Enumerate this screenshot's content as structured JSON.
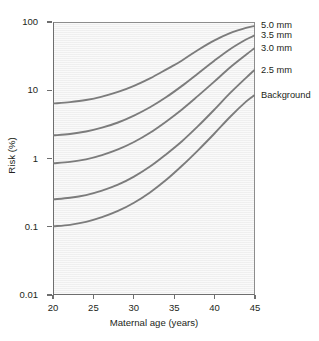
{
  "chart_data": {
    "type": "line",
    "title": "",
    "xlabel": "Maternal age (years)",
    "ylabel": "Risk (%)",
    "xlim": [
      20,
      45
    ],
    "ylim": [
      0.01,
      100
    ],
    "yscale": "log",
    "xscale": "linear",
    "grid": false,
    "legend_position": "right",
    "xticks": [
      "20",
      "25",
      "30",
      "35",
      "40",
      "45"
    ],
    "xtick_values": [
      20,
      25,
      30,
      35,
      40,
      45
    ],
    "yticks": [
      "100",
      "10",
      "1",
      "0.1",
      "0.01"
    ],
    "ytick_values": [
      100,
      10,
      1,
      0.1,
      0.01
    ],
    "x": [
      20,
      22,
      24,
      26,
      28,
      30,
      32,
      34,
      36,
      38,
      40,
      42,
      44,
      45
    ],
    "series": [
      {
        "name": "5.0 mm",
        "color": "#7c7c7c",
        "values": [
          6.5,
          6.8,
          7.3,
          8.2,
          9.6,
          11.8,
          15.2,
          20.5,
          28.0,
          40.0,
          55.0,
          71.0,
          85.0,
          90.0
        ]
      },
      {
        "name": "3.5 mm",
        "color": "#7c7c7c",
        "values": [
          2.2,
          2.3,
          2.5,
          2.85,
          3.4,
          4.3,
          5.7,
          8.0,
          11.8,
          18.0,
          27.5,
          41.0,
          57.0,
          65.0
        ]
      },
      {
        "name": "3.0 mm",
        "color": "#7c7c7c",
        "values": [
          0.85,
          0.89,
          0.97,
          1.12,
          1.36,
          1.75,
          2.4,
          3.5,
          5.3,
          8.4,
          13.5,
          22.0,
          34.0,
          42.0
        ]
      },
      {
        "name": "2.5 mm",
        "color": "#7c7c7c",
        "values": [
          0.25,
          0.263,
          0.288,
          0.335,
          0.41,
          0.54,
          0.76,
          1.15,
          1.8,
          3.0,
          5.2,
          9.2,
          15.5,
          20.0
        ]
      },
      {
        "name": "Background",
        "color": "#7c7c7c",
        "values": [
          0.1,
          0.105,
          0.116,
          0.136,
          0.168,
          0.222,
          0.315,
          0.48,
          0.78,
          1.32,
          2.3,
          4.1,
          6.9,
          8.5
        ]
      }
    ],
    "annotations": []
  },
  "axes": {
    "y_title": "Risk (%)",
    "x_title": "Maternal age (years)",
    "y_tick_labels": [
      "100",
      "10",
      "1",
      "0.1",
      "0.01"
    ],
    "x_tick_labels": [
      "20",
      "25",
      "30",
      "35",
      "40",
      "45"
    ]
  },
  "legend": {
    "items": [
      {
        "label": "5.0 mm"
      },
      {
        "label": "3.5 mm"
      },
      {
        "label": "3.0 mm"
      },
      {
        "label": "2.5 mm"
      },
      {
        "label": "Background"
      }
    ]
  },
  "style": {
    "panel_background": "#f2f2f2",
    "curve_color": "#7c7c7c",
    "axis_color": "#6e6e6e",
    "text_color": "#231f20",
    "page_background": "#ffffff"
  }
}
